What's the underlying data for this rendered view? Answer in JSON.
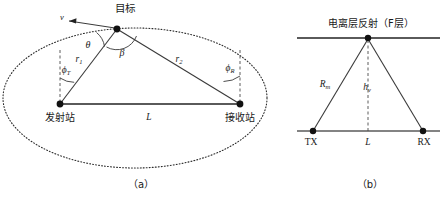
{
  "figure": {
    "panels": [
      {
        "id": "a",
        "caption": "（a）",
        "title": "双基地雷达几何关系",
        "labels": {
          "velocity": "v",
          "target": "目标",
          "angle_theta": "θ",
          "angle_beta": "β",
          "range_tx": "r1",
          "range_rx": "r2",
          "phi_tx": "φT",
          "phi_rx": "φR",
          "baseline": "L",
          "station_tx": "发射站",
          "station_rx": "接收站"
        }
      },
      {
        "id": "b",
        "caption": "（b）",
        "title": "电离层反射路径",
        "labels": {
          "ionosphere": "电离层反射（F层）",
          "slant_range": "Rm",
          "virtual_height": "hv",
          "baseline": "L",
          "station_tx": "TX",
          "station_rx": "RX"
        }
      }
    ],
    "colors": {
      "line": "#3a3a3a",
      "baseline": "#5a5a5a",
      "dotted_ellipse": "#2b2b2b",
      "node": "#111111",
      "text": "#1a1a1a",
      "background": "#ffffff"
    }
  }
}
